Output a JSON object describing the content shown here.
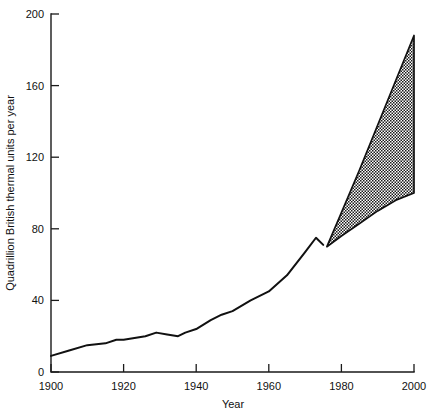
{
  "chart_data": {
    "type": "area",
    "title": "",
    "xlabel": "Year",
    "ylabel": "Quadrillion British thermal units per year",
    "xlim": [
      1900,
      2000
    ],
    "ylim": [
      0,
      200
    ],
    "xticks": [
      1900,
      1920,
      1940,
      1960,
      1980,
      2000
    ],
    "xtick_labels": [
      "1900",
      "1920",
      "1940",
      "1960",
      "1980",
      "2000"
    ],
    "yticks": [
      0,
      40,
      80,
      120,
      160,
      200
    ],
    "ytick_labels": [
      "0",
      "40",
      "80",
      "120",
      "160",
      "200"
    ],
    "grid": false,
    "legend": null,
    "series": [
      {
        "name": "Historical consumption",
        "style": "solid-line",
        "x": [
          1900,
          1905,
          1910,
          1915,
          1918,
          1920,
          1923,
          1926,
          1929,
          1932,
          1935,
          1937,
          1940,
          1944,
          1947,
          1950,
          1955,
          1960,
          1965,
          1970,
          1973,
          1975
        ],
        "values": [
          9,
          12,
          15,
          16,
          18,
          18,
          19,
          20,
          22,
          21,
          20,
          22,
          24,
          29,
          32,
          34,
          40,
          45,
          54,
          67,
          75,
          71
        ]
      },
      {
        "name": "Projection upper bound",
        "style": "dashed-edge",
        "x": [
          1976,
          1980,
          1985,
          1990,
          1995,
          2000
        ],
        "values": [
          70,
          89,
          113,
          138,
          163,
          188
        ]
      },
      {
        "name": "Projection lower bound",
        "style": "solid-edge",
        "x": [
          1976,
          1980,
          1985,
          1990,
          1995,
          2000
        ],
        "values": [
          70,
          76,
          83,
          90,
          96,
          100
        ]
      }
    ],
    "annotations": [
      {
        "text": "hatched projection band between upper and lower bounds, 1976-2000",
        "fill": "crosshatch"
      }
    ],
    "colors": {
      "line": "#111111",
      "axis": "#1a1a1a",
      "band_fill": "#555555",
      "background": "#ffffff"
    }
  }
}
